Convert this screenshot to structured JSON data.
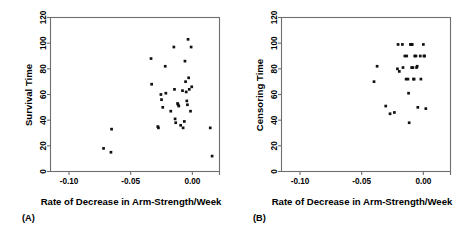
{
  "figure": {
    "panels": [
      {
        "caption": "(A)",
        "xlabel": "Rate of Decrease in Arm-Strength/Week",
        "ylabel": "Survival Time"
      },
      {
        "caption": "(B)",
        "xlabel": "Rate of Decrease in Arm-Strength/Week",
        "ylabel": "Censoring Time"
      }
    ],
    "colors": {
      "point": "#111111",
      "axis": "#6e6e6e",
      "background": "#ffffff"
    }
  },
  "chart_data": [
    {
      "type": "scatter",
      "title": "(A)",
      "xlabel": "Rate of Decrease in Arm-Strength/Week",
      "ylabel": "Survival Time",
      "xlim": [
        -0.115,
        0.022
      ],
      "ylim": [
        0,
        120
      ],
      "xticks": [
        -0.1,
        -0.05,
        0.0
      ],
      "xticklabels": [
        "-0.10",
        "-0.05",
        "0.00"
      ],
      "yticks": [
        0,
        20,
        40,
        60,
        80,
        100,
        120
      ],
      "yticklabels": [
        "0",
        "20",
        "40",
        "60",
        "80",
        "100",
        "120"
      ],
      "grid": false,
      "legend": "none",
      "points": [
        {
          "x": -0.072,
          "y": 18
        },
        {
          "x": -0.066,
          "y": 15
        },
        {
          "x": -0.0655,
          "y": 33
        },
        {
          "x": -0.0335,
          "y": 88
        },
        {
          "x": -0.033,
          "y": 68
        },
        {
          "x": -0.0275,
          "y": 34
        },
        {
          "x": -0.028,
          "y": 35
        },
        {
          "x": -0.0255,
          "y": 60
        },
        {
          "x": -0.025,
          "y": 56
        },
        {
          "x": -0.024,
          "y": 50
        },
        {
          "x": -0.022,
          "y": 82
        },
        {
          "x": -0.0215,
          "y": 61
        },
        {
          "x": -0.0175,
          "y": 47
        },
        {
          "x": -0.015,
          "y": 97
        },
        {
          "x": -0.0145,
          "y": 64
        },
        {
          "x": -0.014,
          "y": 41
        },
        {
          "x": -0.0135,
          "y": 38
        },
        {
          "x": -0.012,
          "y": 53
        },
        {
          "x": -0.0115,
          "y": 52
        },
        {
          "x": -0.011,
          "y": 51
        },
        {
          "x": -0.0095,
          "y": 36
        },
        {
          "x": -0.008,
          "y": 63
        },
        {
          "x": -0.0075,
          "y": 34
        },
        {
          "x": -0.0065,
          "y": 39
        },
        {
          "x": -0.006,
          "y": 86
        },
        {
          "x": -0.0055,
          "y": 70
        },
        {
          "x": -0.005,
          "y": 62
        },
        {
          "x": -0.0045,
          "y": 55
        },
        {
          "x": -0.004,
          "y": 52
        },
        {
          "x": -0.0035,
          "y": 103
        },
        {
          "x": -0.003,
          "y": 73
        },
        {
          "x": -0.0025,
          "y": 64
        },
        {
          "x": -0.0015,
          "y": 47
        },
        {
          "x": -0.001,
          "y": 97
        },
        {
          "x": -0.0005,
          "y": 66
        },
        {
          "x": 0.0145,
          "y": 34
        },
        {
          "x": 0.016,
          "y": 12
        }
      ]
    },
    {
      "type": "scatter",
      "title": "(B)",
      "xlabel": "Rate of Decrease in Arm-Strength/Week",
      "ylabel": "Censoring Time",
      "xlim": [
        -0.115,
        0.022
      ],
      "ylim": [
        0,
        120
      ],
      "xticks": [
        -0.1,
        -0.05,
        0.0
      ],
      "xticklabels": [
        "-0.10",
        "-0.05",
        "0.00"
      ],
      "yticks": [
        0,
        20,
        40,
        60,
        80,
        100,
        120
      ],
      "yticklabels": [
        "0",
        "20",
        "40",
        "60",
        "80",
        "100",
        "120"
      ],
      "grid": false,
      "legend": "none",
      "points": [
        {
          "x": -0.0375,
          "y": 82
        },
        {
          "x": -0.04,
          "y": 70
        },
        {
          "x": -0.0305,
          "y": 51
        },
        {
          "x": -0.027,
          "y": 45
        },
        {
          "x": -0.0235,
          "y": 46
        },
        {
          "x": -0.0205,
          "y": 99
        },
        {
          "x": -0.021,
          "y": 80
        },
        {
          "x": -0.0195,
          "y": 78
        },
        {
          "x": -0.017,
          "y": 99
        },
        {
          "x": -0.0165,
          "y": 81
        },
        {
          "x": -0.015,
          "y": 90
        },
        {
          "x": -0.0135,
          "y": 90
        },
        {
          "x": -0.014,
          "y": 72
        },
        {
          "x": -0.0125,
          "y": 72
        },
        {
          "x": -0.012,
          "y": 61
        },
        {
          "x": -0.0115,
          "y": 38
        },
        {
          "x": -0.0105,
          "y": 99
        },
        {
          "x": -0.01,
          "y": 99
        },
        {
          "x": -0.0095,
          "y": 99
        },
        {
          "x": -0.009,
          "y": 99
        },
        {
          "x": -0.0095,
          "y": 81
        },
        {
          "x": -0.0085,
          "y": 81
        },
        {
          "x": -0.008,
          "y": 72
        },
        {
          "x": -0.0075,
          "y": 72
        },
        {
          "x": -0.007,
          "y": 90
        },
        {
          "x": -0.006,
          "y": 90
        },
        {
          "x": -0.0055,
          "y": 81
        },
        {
          "x": -0.005,
          "y": 82
        },
        {
          "x": -0.0045,
          "y": 50
        },
        {
          "x": -0.0025,
          "y": 90
        },
        {
          "x": -0.002,
          "y": 72
        },
        {
          "x": 0.0,
          "y": 99
        },
        {
          "x": 0.0005,
          "y": 90
        },
        {
          "x": 0.001,
          "y": 90
        },
        {
          "x": 0.002,
          "y": 49
        }
      ]
    }
  ]
}
